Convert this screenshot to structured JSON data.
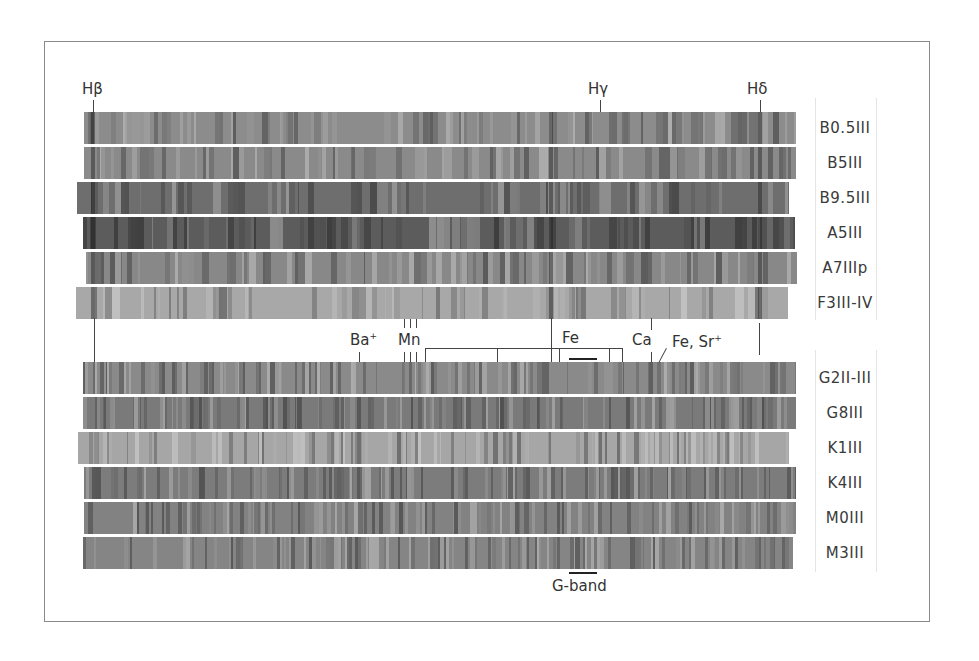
{
  "figure": {
    "top_lines": [
      {
        "label": "Hβ",
        "x": 93
      },
      {
        "label": "Hγ",
        "x": 600
      },
      {
        "label": "Hδ",
        "x": 760
      }
    ],
    "middle_lines": {
      "ba": "Ba",
      "ba_sup": "+",
      "mn": "Mn",
      "fe": "Fe",
      "ca": "Ca",
      "fe_sr": "Fe, Sr",
      "fe_sr_sup": "+"
    },
    "bottom_label": "G-band",
    "top_group": [
      {
        "type": "B0.5III",
        "color": "#8c8c8c",
        "left": 84,
        "right": 796
      },
      {
        "type": "B5III",
        "color": "#8a8a8a",
        "left": 84,
        "right": 796
      },
      {
        "type": "B9.5III",
        "color": "#6e6e6e",
        "left": 77,
        "right": 789
      },
      {
        "type": "A5III",
        "color": "#5c5c5c",
        "left": 83,
        "right": 795
      },
      {
        "type": "A7IIIp",
        "color": "#888888",
        "left": 86,
        "right": 797
      },
      {
        "type": "F3III-IV",
        "color": "#a8a8a8",
        "left": 76,
        "right": 788
      }
    ],
    "bottom_group": [
      {
        "type": "G2II-III",
        "color": "#8a8a8a",
        "left": 83,
        "right": 796
      },
      {
        "type": "G8III",
        "color": "#7a7a7a",
        "left": 83,
        "right": 796
      },
      {
        "type": "K1III",
        "color": "#a6a6a6",
        "left": 78,
        "right": 789
      },
      {
        "type": "K4III",
        "color": "#7c7c7c",
        "left": 84,
        "right": 796
      },
      {
        "type": "M0III",
        "color": "#828282",
        "left": 84,
        "right": 796
      },
      {
        "type": "M3III",
        "color": "#858585",
        "left": 83,
        "right": 793
      }
    ]
  }
}
